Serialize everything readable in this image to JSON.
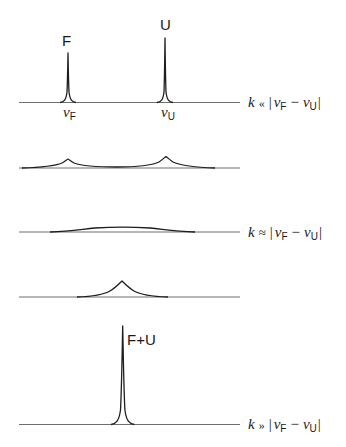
{
  "diagram": {
    "panels": [
      {
        "id": "slow",
        "condition": {
          "k": "k",
          "relation": "«",
          "lhs": "|",
          "nu1": "ν",
          "sub1": "F",
          "minus": "−",
          "nu2": "ν",
          "sub2": "U",
          "rhs": "|"
        },
        "peaks": [
          {
            "label": "F",
            "position_label": {
              "nu": "ν",
              "sub": "F"
            }
          },
          {
            "label": "U",
            "position_label": {
              "nu": "ν",
              "sub": "U"
            }
          }
        ],
        "shape": "two sharp peaks"
      },
      {
        "id": "intermediate-1",
        "shape": "two broadened peaks"
      },
      {
        "id": "coalescence",
        "condition": {
          "k": "k",
          "relation": "≈",
          "lhs": "|",
          "nu1": "ν",
          "sub1": "F",
          "minus": "−",
          "nu2": "ν",
          "sub2": "U",
          "rhs": "|"
        },
        "shape": "single flat broad band"
      },
      {
        "id": "intermediate-2",
        "shape": "single broadened peak at average position"
      },
      {
        "id": "fast",
        "condition": {
          "k": "k",
          "relation": "»",
          "lhs": "|",
          "nu1": "ν",
          "sub1": "F",
          "minus": "−",
          "nu2": "ν",
          "sub2": "U",
          "rhs": "|"
        },
        "peaks": [
          {
            "label": "F+U"
          }
        ],
        "shape": "single sharp averaged peak"
      }
    ],
    "colors": {
      "line": "#1e1e1e",
      "baseline": "#6e6e6e",
      "text": "#1a1a1a",
      "background": "#ffffff"
    }
  }
}
